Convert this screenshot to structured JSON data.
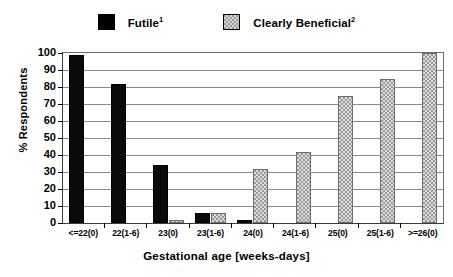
{
  "chart_data": {
    "type": "bar",
    "title": "",
    "xlabel": "Gestational age [weeks-days]",
    "ylabel": "% Respondents",
    "ylim": [
      0,
      100
    ],
    "yticks": [
      100,
      90,
      80,
      70,
      60,
      50,
      40,
      30,
      20,
      10,
      0
    ],
    "grid": true,
    "legend_position": "top",
    "categories": [
      "<=22(0)",
      "22(1-6)",
      "23(0)",
      "23(1-6)",
      "24(0)",
      "24(1-6)",
      "25(0)",
      "25(1-6)",
      ">=26(0)"
    ],
    "series": [
      {
        "name": "Futile",
        "footnote": "1",
        "color": "#000000",
        "pattern": "solid",
        "values": [
          99,
          82,
          34,
          6,
          2,
          0,
          0,
          0,
          0
        ]
      },
      {
        "name": "Clearly Beneficial",
        "footnote": "2",
        "color": "#9a9a9a",
        "pattern": "checker",
        "values": [
          0,
          0,
          2,
          6,
          32,
          42,
          75,
          85,
          100
        ]
      }
    ]
  },
  "legend": {
    "items": [
      {
        "label": "Futile",
        "footnote": "1",
        "swatch": "solid-black-swatch"
      },
      {
        "label": "Clearly Beneficial",
        "footnote": "2",
        "swatch": "checkered-gray-swatch"
      }
    ]
  },
  "axes": {
    "y_title": "% Respondents",
    "x_title": "Gestational age [weeks-days]"
  }
}
